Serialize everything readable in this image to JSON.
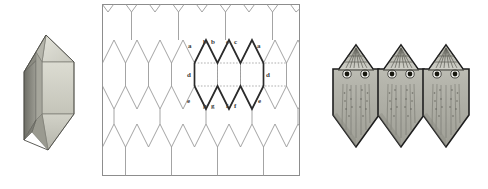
{
  "figure": {
    "panels": [
      {
        "id": "crystal",
        "name": "3d-crystal-solid",
        "description": "shaded polyhedron crystal"
      },
      {
        "id": "tiling",
        "name": "tessellation-diagram",
        "description": "periodic tiling with highlighted unit cell"
      },
      {
        "id": "figures",
        "name": "tessellating-owl-figures",
        "description": "three interlocking shaded owl-like tiles"
      }
    ]
  },
  "tiling": {
    "edge_labels_top": [
      "a",
      "b",
      "b",
      "c",
      "c",
      "a"
    ],
    "edge_labels_side": [
      "d",
      "d"
    ],
    "edge_labels_bottom": [
      "e",
      "g",
      "g",
      "f",
      "f",
      "e"
    ],
    "label_a": "a",
    "label_b": "b",
    "label_c": "c",
    "label_d": "d",
    "label_e": "e",
    "label_f": "f",
    "label_g": "g"
  },
  "colors": {
    "background": "#ffffff",
    "grid_line": "#9a9a9a",
    "highlight_line": "#2b2b2b",
    "dotted_line": "#9a9a9a",
    "frame": "#8d8d8d",
    "crystal_light": "#d9d9cf",
    "crystal_mid": "#c6c6bb",
    "crystal_dark": "#8e8e85",
    "crystal_shadow": "#6f6f68",
    "figure_body": "#b9b9b1",
    "figure_outline": "#1e1e1e",
    "label_text": "#3a3a3a"
  }
}
